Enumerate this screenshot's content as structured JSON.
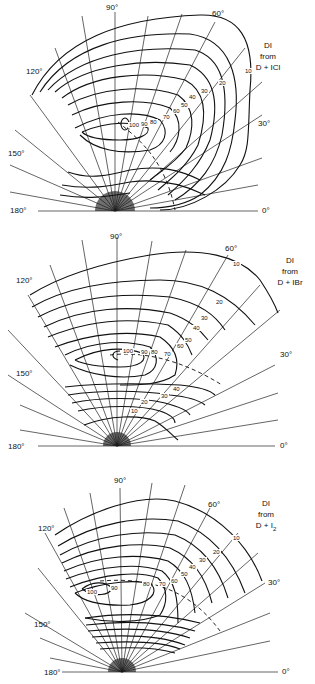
{
  "panels": [
    {
      "id": "icl",
      "title_line1": "DI",
      "title_line2": "from",
      "title_line3": "D + ICl",
      "angle_labels": {
        "a0": "0°",
        "a30": "30°",
        "a60": "60°",
        "a90": "90°",
        "a120": "120°",
        "a150": "150°",
        "a180": "180°"
      },
      "contour_labels": [
        "10",
        "20",
        "30",
        "40",
        "50",
        "60",
        "70",
        "80",
        "90",
        "100"
      ]
    },
    {
      "id": "ibr",
      "title_line1": "DI",
      "title_line2": "from",
      "title_line3": "D + IBr",
      "angle_labels": {
        "a0": "0°",
        "a30": "30°",
        "a60": "60°",
        "a90": "90°",
        "a120": "120°",
        "a150": "150°",
        "a180": "180°"
      },
      "contour_labels": [
        "10",
        "20",
        "30",
        "40",
        "50",
        "60",
        "70",
        "80",
        "90",
        "100"
      ],
      "lower_labels": [
        "40",
        "30",
        "20",
        "10"
      ]
    },
    {
      "id": "i2",
      "title_line1": "DI",
      "title_line2": "from",
      "title_line3_main": "D + I",
      "title_line3_sub": "2",
      "angle_labels": {
        "a0": "0°",
        "a30": "30°",
        "a60": "60°",
        "a90": "90°",
        "a120": "120°",
        "a150": "150°",
        "a180": "180°"
      },
      "contour_labels": [
        "10",
        "20",
        "30",
        "40",
        "50",
        "60",
        "70",
        "80",
        "90",
        "100"
      ]
    }
  ]
}
